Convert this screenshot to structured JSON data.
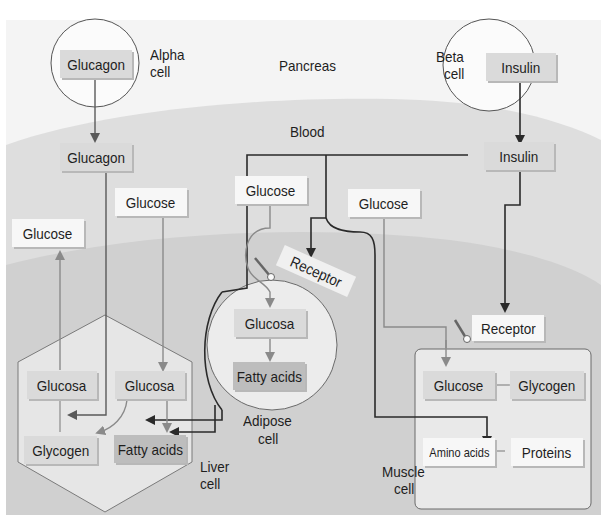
{
  "diagram": {
    "regions": {
      "pancreas": "Pancreas",
      "blood": "Blood"
    },
    "alpha_cell": {
      "label_line1": "Alpha",
      "label_line2": "cell",
      "hormone": "Glucagon"
    },
    "beta_cell": {
      "label_line1": "Beta",
      "label_line2": "cell",
      "hormone": "Insulin"
    },
    "blood_boxes": {
      "glucagon": "Glucagon",
      "insulin": "Insulin",
      "glucose_left": "Glucose",
      "glucose_liver": "Glucose",
      "glucose_adipose": "Glucose",
      "glucose_muscle": "Glucose"
    },
    "liver_cell": {
      "label_line1": "Liver",
      "label_line2": "cell",
      "glucosa_left": "Glucosa",
      "glucosa_right": "Glucosa",
      "glycogen": "Glycogen",
      "fatty_acids": "Fatty acids"
    },
    "adipose_cell": {
      "label_line1": "Adipose",
      "label_line2": "cell",
      "receptor": "Receptor",
      "glucosa": "Glucosa",
      "fatty_acids": "Fatty acids"
    },
    "muscle_cell": {
      "label_line1": "Muscle",
      "label_line2": "cell",
      "receptor": "Receptor",
      "glucose": "Glucose",
      "glycogen": "Glycogen",
      "amino_acids": "Amino acids",
      "proteins": "Proteins"
    },
    "colors": {
      "pancreas_bg": "#f4f4f4",
      "blood_bg": "#dedede",
      "tissue_bg": "#cfcfcf",
      "cell_fill": "#e9e9e9",
      "line_dark": "#2a2a2a",
      "line_gray": "#8a8a8a"
    }
  }
}
